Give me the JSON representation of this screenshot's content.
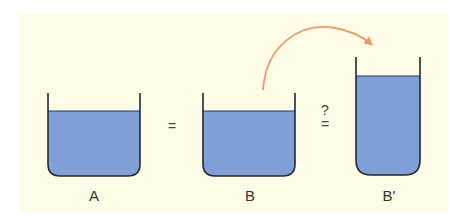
{
  "diagram": {
    "colors": {
      "background": "#fefbe6",
      "liquid": "#7f9fd6",
      "outline": "#1f2a3a",
      "arrow": "#ef9a6a"
    },
    "containers": [
      {
        "id": "A",
        "label": "A",
        "shape": "wide",
        "fill_level": "medium"
      },
      {
        "id": "B",
        "label": "B",
        "shape": "wide",
        "fill_level": "medium"
      },
      {
        "id": "B_prime",
        "label": "B'",
        "shape": "narrow-tall",
        "fill_level": "high"
      }
    ],
    "operators": {
      "a_to_b": "=",
      "b_to_bprime_question": "?",
      "b_to_bprime_equals": "="
    },
    "arrow": {
      "from": "B",
      "to": "B'",
      "meaning": "pour liquid from B into B'"
    }
  }
}
